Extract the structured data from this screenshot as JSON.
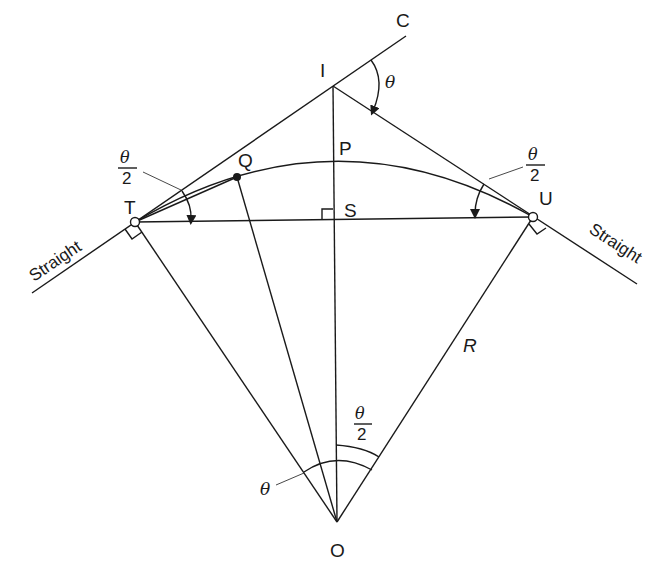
{
  "diagram": {
    "points": {
      "I": "I",
      "C": "C",
      "T": "T",
      "U": "U",
      "P": "P",
      "Q": "Q",
      "S": "S",
      "O": "O"
    },
    "labels": {
      "straight_left": "Straight",
      "straight_right": "Straight",
      "radius": "R",
      "deflection_angle": "θ",
      "half_angle_numerator": "θ",
      "half_angle_denominator": "2",
      "centre_angle": "θ"
    },
    "colors": {
      "ink": "#1a1a1a",
      "background": "#ffffff"
    }
  }
}
